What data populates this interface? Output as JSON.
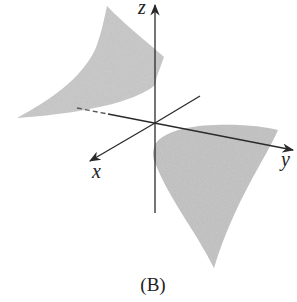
{
  "figure": {
    "caption": "(B)",
    "axes": {
      "x_label": "x",
      "y_label": "y",
      "z_label": "z"
    },
    "surface_color": "#c4c4c4",
    "axis_color": "#2a2a2a"
  }
}
